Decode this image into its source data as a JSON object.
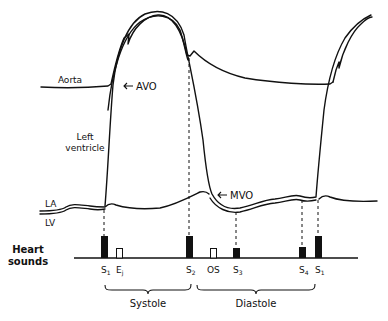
{
  "diagram": {
    "labels": {
      "aorta": "Aorta",
      "avo": "AVO",
      "left_ventricle_line1": "Left",
      "left_ventricle_line2": "ventricle",
      "la": "LA",
      "lv": "LV",
      "mvo": "MVO",
      "heart_sounds_line1": "Heart",
      "heart_sounds_line2": "sounds"
    },
    "sounds": [
      {
        "label": "S",
        "sub": "1",
        "type": "filled"
      },
      {
        "label": "E",
        "sub": "j",
        "type": "open"
      },
      {
        "label": "S",
        "sub": "2",
        "type": "filled"
      },
      {
        "label": "OS",
        "sub": "",
        "type": "open"
      },
      {
        "label": "S",
        "sub": "3",
        "type": "filled"
      },
      {
        "label": "S",
        "sub": "4",
        "type": "filled"
      },
      {
        "label": "S",
        "sub": "1",
        "type": "filled"
      }
    ],
    "phases": {
      "systole": "Systole",
      "diastole": "Diastole"
    },
    "colors": {
      "ink": "#111111",
      "background": "#ffffff"
    }
  }
}
